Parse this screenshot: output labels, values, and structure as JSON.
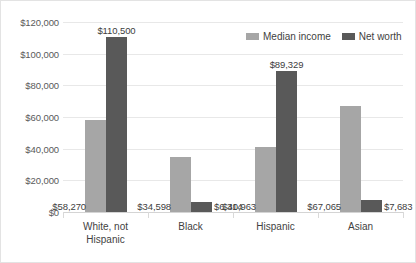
{
  "chart_data": {
    "type": "bar",
    "title": "",
    "xlabel": "",
    "ylabel": "",
    "categories": [
      "White, not Hispanic",
      "Black",
      "Hispanic",
      "Asian"
    ],
    "category_lines": [
      [
        "White, not",
        "Hispanic"
      ],
      [
        "Black"
      ],
      [
        "Hispanic"
      ],
      [
        "Asian"
      ]
    ],
    "series": [
      {
        "name": "Median income",
        "color": "#a6a6a6",
        "values": [
          58270,
          34598,
          40963,
          67065
        ],
        "labels": [
          "$58,270",
          "$34,598",
          "$40,963",
          "$67,065"
        ]
      },
      {
        "name": "Net worth",
        "color": "#595959",
        "values": [
          110500,
          6314,
          89329,
          7683
        ],
        "labels": [
          "$110,500",
          "$6,314",
          "$89,329",
          "$7,683"
        ]
      }
    ],
    "ylim": [
      0,
      120000
    ],
    "ytick_values": [
      0,
      20000,
      40000,
      60000,
      80000,
      100000,
      120000
    ],
    "ytick_labels": [
      "$0",
      "$20,000",
      "$40,000",
      "$60,000",
      "$80,000",
      "$100,000",
      "$120,000"
    ],
    "grid": true,
    "legend_position": "top-right"
  }
}
